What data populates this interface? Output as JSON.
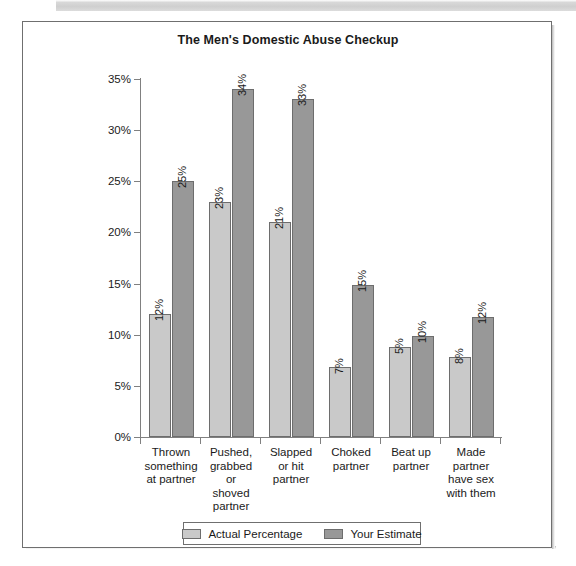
{
  "scan": {
    "band_color": "#d4d4d4"
  },
  "card": {
    "border_color": "#6f6f6f"
  },
  "chart_data": {
    "type": "bar",
    "title": "The Men's Domestic Abuse Checkup",
    "xlabel": "",
    "ylabel": "",
    "ylim": [
      0,
      35
    ],
    "ytick_labels": [
      "0%",
      "5%",
      "10%",
      "15%",
      "20%",
      "25%",
      "30%",
      "35%"
    ],
    "ytick_values": [
      0,
      5,
      10,
      15,
      20,
      25,
      30,
      35
    ],
    "grid": false,
    "legend_position": "bottom",
    "categories": [
      "Thrown something at partner",
      "Pushed, grabbed or shoved partner",
      "Slapped or hit partner",
      "Choked partner",
      "Beat up partner",
      "Made partner have sex with them"
    ],
    "category_lines": [
      [
        "Thrown",
        "something",
        "at partner"
      ],
      [
        "Pushed,",
        "grabbed",
        "or",
        "shoved",
        "partner"
      ],
      [
        "Slapped",
        "or hit",
        "partner"
      ],
      [
        "Choked",
        "partner"
      ],
      [
        "Beat up",
        "partner"
      ],
      [
        "Made",
        "partner",
        "have sex",
        "with them"
      ]
    ],
    "series": [
      {
        "name": "Actual Percentage",
        "color": "#c9c9c9",
        "values": [
          12,
          23,
          21,
          7,
          5,
          8
        ],
        "value_labels": [
          "12%",
          "23%",
          "21%",
          "7%",
          "5%",
          "8%"
        ],
        "drawn_heights": [
          12,
          23,
          21,
          6.8,
          8.8,
          7.8
        ]
      },
      {
        "name": "Your Estimate",
        "color": "#989898",
        "values": [
          25,
          34,
          33,
          15,
          10,
          12
        ],
        "value_labels": [
          "25%",
          "34%",
          "33%",
          "15%",
          "10%",
          "12%"
        ],
        "drawn_heights": [
          25,
          34,
          33,
          14.9,
          9.9,
          11.7
        ]
      }
    ]
  }
}
